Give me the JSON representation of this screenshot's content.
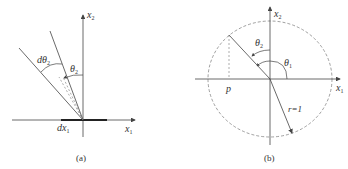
{
  "panel_a": {
    "caption": "(a)",
    "labels": {
      "x1_axis": "x",
      "x1_sub": "1",
      "x2_axis": "x",
      "x2_sub": "2",
      "dtheta": "dθ",
      "dtheta_sub": "2",
      "theta": "θ",
      "theta_sub": "2",
      "dx": "dx",
      "dx_sub": "1"
    }
  },
  "panel_b": {
    "caption": "(b)",
    "labels": {
      "x1_axis": "x",
      "x1_sub": "1",
      "x2_axis": "x",
      "x2_sub": "2",
      "theta2": "θ",
      "theta2_sub": "2",
      "theta1": "θ",
      "theta1_sub": "1",
      "p": "p",
      "radius": "r=1"
    }
  },
  "colors": {
    "line": "#444444",
    "dashed": "#777777",
    "text": "#333333"
  }
}
